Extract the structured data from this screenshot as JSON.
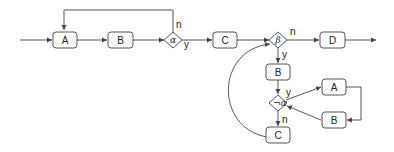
{
  "diagram": {
    "type": "flowchart",
    "colors": {
      "stroke": "#555555",
      "text": "#222222",
      "background": "#ffffff"
    },
    "nodes": {
      "A1": {
        "label": "A",
        "shape": "rounded-rect"
      },
      "B1": {
        "label": "B",
        "shape": "rounded-rect"
      },
      "alpha": {
        "label": "α",
        "shape": "diamond"
      },
      "C1": {
        "label": "C",
        "shape": "rounded-rect"
      },
      "beta": {
        "label": "β",
        "shape": "diamond"
      },
      "D": {
        "label": "D",
        "shape": "rounded-rect"
      },
      "B2": {
        "label": "B",
        "shape": "rounded-rect"
      },
      "notalpha": {
        "label": "¬α",
        "shape": "diamond"
      },
      "A2": {
        "label": "A",
        "shape": "rounded-rect"
      },
      "B3": {
        "label": "B",
        "shape": "rounded-rect"
      },
      "C2": {
        "label": "C",
        "shape": "rounded-rect"
      }
    },
    "edge_labels": {
      "alpha_n": "n",
      "alpha_y": "y",
      "beta_n": "n",
      "beta_y": "y",
      "notalpha_y": "y",
      "notalpha_n": "n"
    },
    "edges": [
      {
        "from": "start",
        "to": "A1"
      },
      {
        "from": "A1",
        "to": "B1"
      },
      {
        "from": "B1",
        "to": "alpha"
      },
      {
        "from": "alpha",
        "to": "A1",
        "label": "n"
      },
      {
        "from": "alpha",
        "to": "C1",
        "label": "y"
      },
      {
        "from": "C1",
        "to": "beta"
      },
      {
        "from": "beta",
        "to": "D",
        "label": "n"
      },
      {
        "from": "D",
        "to": "end"
      },
      {
        "from": "beta",
        "to": "B2",
        "label": "y"
      },
      {
        "from": "B2",
        "to": "notalpha"
      },
      {
        "from": "notalpha",
        "to": "A2",
        "label": "y"
      },
      {
        "from": "A2",
        "to": "B3"
      },
      {
        "from": "B3",
        "to": "notalpha"
      },
      {
        "from": "notalpha",
        "to": "C2",
        "label": "n"
      },
      {
        "from": "C2",
        "to": "beta"
      }
    ]
  }
}
